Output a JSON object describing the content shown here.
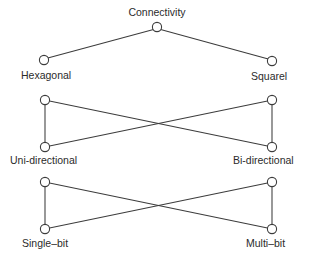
{
  "diagram": {
    "type": "hierarchy-lattice",
    "title": "Connectivity",
    "background_color": "#ffffff",
    "stroke_color": "#3c3c3c",
    "node_fill_color": "#ffffff",
    "text_color": "#2b2b2b",
    "groups": [
      {
        "name": "connectivity-group",
        "shape": "v-fork",
        "apex_label": "Connectivity",
        "left_label": "Hexagonal",
        "right_label": "Squarel",
        "nodes": [
          {
            "id": "apex",
            "label": "Connectivity",
            "x": 157,
            "y": 27,
            "r": 4.6
          },
          {
            "id": "left",
            "label": "Hexagonal",
            "x": 44,
            "y": 60,
            "r": 4.6
          },
          {
            "id": "right",
            "label": "Squarel",
            "x": 272,
            "y": 61,
            "r": 4.6
          }
        ],
        "edges": [
          {
            "from": "apex",
            "to": "left"
          },
          {
            "from": "apex",
            "to": "right"
          }
        ]
      },
      {
        "name": "directionality-group",
        "shape": "crossed-rectangle",
        "left_label": "Uni-directional",
        "right_label": "Bi-directional",
        "nodes": [
          {
            "id": "tl",
            "x": 45,
            "y": 100,
            "r": 4.6
          },
          {
            "id": "bl",
            "x": 45,
            "y": 147,
            "r": 4.6
          },
          {
            "id": "tr",
            "x": 272,
            "y": 100,
            "r": 4.6
          },
          {
            "id": "br",
            "x": 272,
            "y": 147,
            "r": 4.6
          }
        ],
        "edges": [
          {
            "from": "tl",
            "to": "bl"
          },
          {
            "from": "tr",
            "to": "br"
          },
          {
            "from": "tl",
            "to": "br"
          },
          {
            "from": "bl",
            "to": "tr"
          }
        ]
      },
      {
        "name": "bitwidth-group",
        "shape": "crossed-rectangle",
        "left_label": "Single–bit",
        "right_label": "Multi–bit",
        "nodes": [
          {
            "id": "tl",
            "x": 45,
            "y": 182,
            "r": 4.6
          },
          {
            "id": "bl",
            "x": 45,
            "y": 229,
            "r": 4.6
          },
          {
            "id": "tr",
            "x": 272,
            "y": 182,
            "r": 4.6
          },
          {
            "id": "br",
            "x": 272,
            "y": 229,
            "r": 4.6
          }
        ],
        "edges": [
          {
            "from": "tl",
            "to": "bl"
          },
          {
            "from": "tr",
            "to": "br"
          },
          {
            "from": "tl",
            "to": "br"
          },
          {
            "from": "bl",
            "to": "tr"
          }
        ]
      }
    ],
    "labels": {
      "connectivity": "Connectivity",
      "hexagonal": "Hexagonal",
      "squarel": "Squarel",
      "uni_directional": "Uni-directional",
      "bi_directional": "Bi-directional",
      "single_bit": "Single–bit",
      "multi_bit": "Multi–bit"
    }
  }
}
